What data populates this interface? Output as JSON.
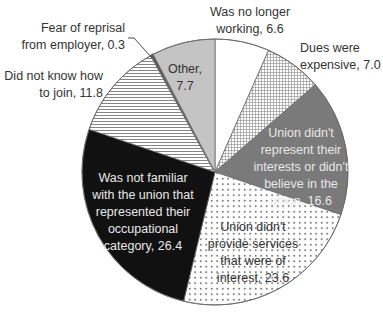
{
  "chart_data": {
    "type": "pie",
    "title": "",
    "start_angle_deg": 0,
    "direction": "clockwise",
    "center": [
      215,
      172
    ],
    "radius": 133,
    "slices": [
      {
        "label": "Was no longer working",
        "value": 6.6,
        "fill": "#ffffff",
        "pattern": "none",
        "text_lines": [
          "Was no longer",
          "working, 6.6"
        ],
        "text_pos": [
          250,
          16
        ],
        "text_anchor": "middle",
        "text_color": "#333333"
      },
      {
        "label": "Dues were expensive",
        "value": 7.0,
        "fill": "#ffffff",
        "pattern": "grid",
        "text_lines": [
          "Dues were",
          "expensive, 7.0"
        ],
        "text_pos": [
          300,
          52
        ],
        "text_anchor": "start",
        "text_color": "#333333"
      },
      {
        "label": "Union didn't represent their interests or didn't believe in the union",
        "value": 16.6,
        "fill": "#7a7a7a",
        "pattern": "none",
        "text_lines": [
          "Union didn't",
          "represent their",
          "interests or didn't",
          "believe in the",
          "union, 16.6"
        ],
        "text_pos": [
          301,
          137
        ],
        "text_anchor": "middle",
        "text_color": "#e8e8e8"
      },
      {
        "label": "Union didn't provide services that were of interest",
        "value": 23.6,
        "fill": "#ffffff",
        "pattern": "dots",
        "text_lines": [
          "Union didn't",
          "provide services",
          "that were of",
          "interest, 23.6"
        ],
        "text_pos": [
          253,
          231
        ],
        "text_anchor": "middle",
        "text_color": "#333333"
      },
      {
        "label": "Was not familiar with the union that represented their occupational category",
        "value": 26.4,
        "fill": "#111111",
        "pattern": "none",
        "text_lines": [
          "Was not familiar",
          "with the union that",
          "represented their",
          "occupational",
          "category, 26.4"
        ],
        "text_pos": [
          143,
          182
        ],
        "text_anchor": "middle",
        "text_color": "#e8e8e8"
      },
      {
        "label": "Did not know how to join",
        "value": 11.8,
        "fill": "#ffffff",
        "pattern": "hlines",
        "text_lines": [
          "Did not know how",
          "to join, 11.8"
        ],
        "text_pos": [
          103,
          80
        ],
        "text_anchor": "end",
        "text_color": "#333333"
      },
      {
        "label": "Fear of reprisal from employer",
        "value": 0.3,
        "fill": "#444444",
        "pattern": "none",
        "text_lines": [
          "Fear of reprisal",
          "from employer, 0.3"
        ],
        "text_pos": [
          125,
          32
        ],
        "text_anchor": "end",
        "text_color": "#333333",
        "leader": [
          [
            128,
            38
          ],
          [
            134,
            38
          ],
          [
            152,
            58
          ]
        ]
      },
      {
        "label": "Other",
        "value": 7.7,
        "fill": "#c4c4c4",
        "pattern": "none",
        "text_lines": [
          "Other,",
          "7.7"
        ],
        "text_pos": [
          185,
          73
        ],
        "text_anchor": "middle",
        "text_color": "#333333"
      }
    ],
    "legend": null,
    "units": "%"
  }
}
